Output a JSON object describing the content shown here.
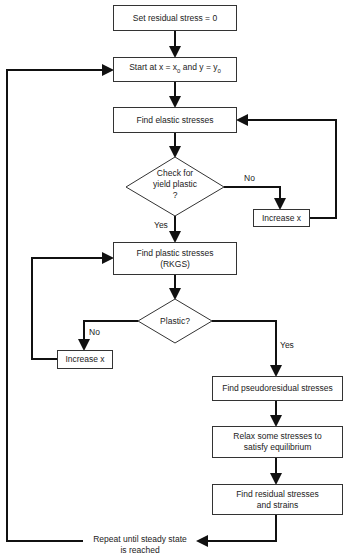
{
  "diagram": {
    "type": "flowchart",
    "nodes": {
      "set_residual": "Set residual stress = 0",
      "start_prefix": "Start at x = x",
      "start_mid": " and y = y",
      "start_sub": "0",
      "find_elastic": "Find elastic stresses",
      "check_yield_l1": "Check for",
      "check_yield_l2": "yield plastic",
      "check_yield_l3": "?",
      "increase_x_1": "Increase x",
      "find_plastic_l1": "Find plastic stresses",
      "find_plastic_l2": "(RKGS)",
      "plastic_q": "Plastic?",
      "increase_x_2": "Increase x",
      "find_pseudo": "Find pseudoresidual stresses",
      "relax_l1": "Relax some stresses to",
      "relax_l2": "satisfy equilibrium",
      "find_residual_l1": "Find residual stresses",
      "find_residual_l2": "and strains",
      "repeat_l1": "Repeat until steady state",
      "repeat_l2": "is reached"
    },
    "edge_labels": {
      "yield_no": "No",
      "yield_yes": "Yes",
      "plastic_no": "No",
      "plastic_yes": "Yes"
    },
    "colors": {
      "line": "#111111",
      "box_border": "#333333",
      "background": "#ffffff"
    }
  }
}
